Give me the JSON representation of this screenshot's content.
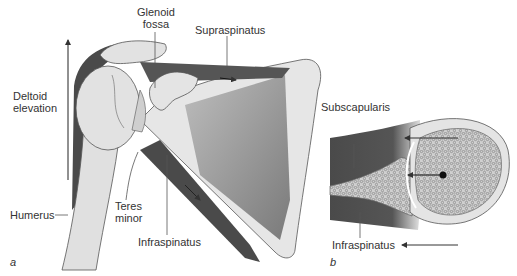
{
  "figure": {
    "panel_a": {
      "letter": "a",
      "labels": {
        "glenoid_line1": "Glenoid",
        "glenoid_line2": "fossa",
        "supraspinatus": "Supraspinatus",
        "deltoid_line1": "Deltoid",
        "deltoid_line2": "elevation",
        "humerus": "Humerus",
        "teres_line1": "Teres",
        "teres_line2": "minor",
        "infraspinatus": "Infraspinatus"
      }
    },
    "panel_b": {
      "letter": "b",
      "labels": {
        "subscapularis": "Subscapularis",
        "infraspinatus": "Infraspinatus"
      }
    },
    "colors": {
      "muscle_dark": "#4a4a4a",
      "bone_light": "#e2e2e2",
      "bone_mid": "#c8c8c8",
      "scapula_gray": "#8c8c8c",
      "outline": "#555555",
      "text": "#333333"
    }
  }
}
